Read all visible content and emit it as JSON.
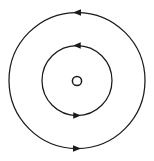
{
  "canvas": {
    "width": 154,
    "height": 161,
    "background_color": "#ffffff",
    "stroke_color": "#1a1a1a"
  },
  "diagram": {
    "name": "Bohr atomic model orbit diagram",
    "center": {
      "x": 77,
      "y": 80.5
    }
  },
  "nucleus": {
    "label": "nucleus",
    "shape": "circle-outline",
    "center_x": 77,
    "center_y": 81,
    "radius": 4.6,
    "stroke_width": 1.5,
    "stroke_color": "#1a1a1a",
    "fill": "none"
  },
  "orbits": [
    {
      "id": "inner-orbit",
      "label": "inner orbit",
      "center_x": 77,
      "center_y": 80.5,
      "radius": 35,
      "stroke_width": 1.25,
      "stroke_color": "#1a1a1a",
      "direction": "clockwise",
      "arrows": [
        {
          "id": "inner-orbit-arrow-top",
          "label": "inner orbit top arrowhead",
          "position": "top",
          "angle_deg": 270,
          "points_toward": "right",
          "tip_x": 82,
          "tip_y": 45.2,
          "size": 7.5,
          "fill_color": "#1a1a1a"
        },
        {
          "id": "inner-orbit-arrow-bottom",
          "label": "inner orbit bottom arrowhead",
          "position": "bottom",
          "angle_deg": 90,
          "points_toward": "left",
          "tip_x": 72,
          "tip_y": 115.8,
          "size": 7.5,
          "fill_color": "#1a1a1a"
        }
      ]
    },
    {
      "id": "outer-orbit",
      "label": "outer orbit",
      "center_x": 77,
      "center_y": 80.5,
      "radius": 68,
      "stroke_width": 1.25,
      "stroke_color": "#1a1a1a",
      "direction": "clockwise",
      "arrows": [
        {
          "id": "outer-orbit-arrow-top",
          "label": "outer orbit top arrowhead",
          "position": "top",
          "angle_deg": 270,
          "points_toward": "right",
          "tip_x": 82,
          "tip_y": 12.3,
          "size": 8,
          "fill_color": "#1a1a1a"
        },
        {
          "id": "outer-orbit-arrow-bottom",
          "label": "outer orbit bottom arrowhead",
          "position": "bottom",
          "angle_deg": 90,
          "points_toward": "left",
          "tip_x": 72,
          "tip_y": 148.7,
          "size": 8,
          "fill_color": "#1a1a1a"
        }
      ]
    }
  ],
  "accessibility": {
    "alt_text": "Diagram of an atom: a small circle at the center representing the nucleus, surrounded by two concentric circular electron orbits, each with arrowheads at the top and bottom showing clockwise motion."
  }
}
